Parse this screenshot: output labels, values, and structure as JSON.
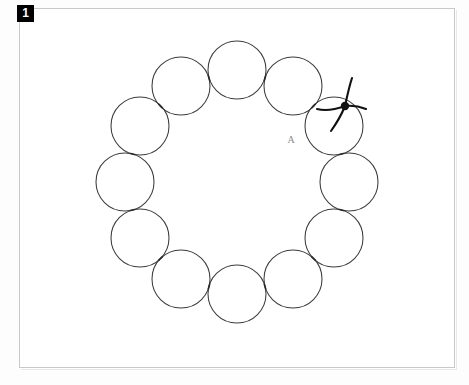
{
  "figure": {
    "panel_number": "1",
    "frame": {
      "x": 19,
      "y": 8,
      "width": 436,
      "height": 360
    },
    "background_color": "#ffffff",
    "frame_border_color": "#c9c9c9",
    "badge_background": "#000000",
    "badge_text_color": "#ffffff"
  },
  "diagram": {
    "type": "ring-of-tangent-circles",
    "stroke_color": "#3b3b3b",
    "ring_center": {
      "x": 237,
      "y": 182
    },
    "ring_radius": 112,
    "circle_radius": 29,
    "circle_count": 12,
    "circles": [
      {
        "id": "c1",
        "cx": 237,
        "cy": 70,
        "label": ""
      },
      {
        "id": "c2",
        "cx": 293,
        "cy": 86,
        "label": ""
      },
      {
        "id": "c3",
        "cx": 334,
        "cy": 126,
        "label": ""
      },
      {
        "id": "c4",
        "cx": 349,
        "cy": 182,
        "label": ""
      },
      {
        "id": "c5",
        "cx": 334,
        "cy": 238,
        "label": ""
      },
      {
        "id": "c6",
        "cx": 293,
        "cy": 279,
        "label": ""
      },
      {
        "id": "c7",
        "cx": 237,
        "cy": 294,
        "label": ""
      },
      {
        "id": "c8",
        "cx": 181,
        "cy": 279,
        "label": ""
      },
      {
        "id": "c9",
        "cx": 140,
        "cy": 238,
        "label": ""
      },
      {
        "id": "c10",
        "cx": 125,
        "cy": 182,
        "label": ""
      },
      {
        "id": "c11",
        "cx": 140,
        "cy": 126,
        "label": ""
      },
      {
        "id": "c12",
        "cx": 181,
        "cy": 86,
        "label": ""
      }
    ],
    "tangency_marks": 12,
    "annotations": [
      {
        "name": "point-label-a",
        "text": "A",
        "x": 291,
        "y": 143,
        "color": "#8d8d8d"
      }
    ],
    "junction": {
      "name": "branch-node",
      "x": 345,
      "y": 106,
      "blob_radius": 4.2,
      "color": "#111111",
      "arm_count": 4,
      "arms": [
        {
          "id": "arm-up-right",
          "path": "M345,106 C348,92 350,84 352,78"
        },
        {
          "id": "arm-right",
          "path": "M345,106 C354,105 361,107 366,109"
        },
        {
          "id": "arm-down",
          "path": "M345,106 C341,116 336,124 331,131"
        },
        {
          "id": "arm-left",
          "path": "M345,106 C334,110 325,111 317,109"
        }
      ]
    }
  }
}
